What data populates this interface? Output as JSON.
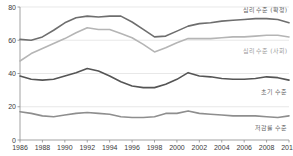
{
  "chart_data": {
    "type": "line",
    "title": "",
    "subtitle": "",
    "xlabel": "",
    "ylabel": "",
    "xlim": [
      1986,
      2010
    ],
    "ylim": [
      0,
      80
    ],
    "yticks": [
      0,
      20,
      40,
      60,
      80
    ],
    "xticks": [
      1986,
      1988,
      1990,
      1992,
      1994,
      1996,
      1998,
      2000,
      2002,
      2004,
      2006,
      2008,
      2010
    ],
    "grid": true,
    "legend_position": "inline-right",
    "x": [
      1986,
      1987,
      1988,
      1989,
      1990,
      1991,
      1992,
      1993,
      1994,
      1995,
      1996,
      1997,
      1998,
      1999,
      2000,
      2001,
      2002,
      2003,
      2004,
      2005,
      2006,
      2007,
      2008,
      2009,
      2010
    ],
    "series": [
      {
        "name": "심리 수준 (확정)",
        "color": "#6e6e6e",
        "values": [
          60.5,
          60.0,
          62.0,
          66.0,
          70.5,
          73.5,
          74.5,
          74.0,
          74.5,
          74.5,
          71.0,
          66.5,
          62.0,
          62.5,
          65.5,
          68.5,
          70.0,
          70.5,
          71.5,
          72.0,
          72.5,
          73.0,
          73.0,
          72.5,
          70.5
        ]
      },
      {
        "name": "심리 수준 (사회)",
        "color": "#b5b5b5",
        "values": [
          47.5,
          52.0,
          55.0,
          58.0,
          61.0,
          64.5,
          67.5,
          66.5,
          66.5,
          64.0,
          61.5,
          57.5,
          53.0,
          55.5,
          58.5,
          61.0,
          61.0,
          61.0,
          61.5,
          62.0,
          62.0,
          62.5,
          63.0,
          63.0,
          62.0
        ]
      },
      {
        "name": "초기 수준",
        "color": "#555555",
        "values": [
          38.5,
          36.5,
          36.0,
          36.5,
          38.5,
          40.5,
          43.0,
          41.5,
          38.5,
          35.0,
          32.5,
          31.5,
          31.5,
          33.5,
          36.5,
          40.5,
          38.5,
          38.0,
          37.0,
          36.5,
          36.5,
          37.0,
          38.0,
          37.5,
          36.0
        ]
      },
      {
        "name": "저감률 수준",
        "color": "#8e8e8e",
        "values": [
          17.0,
          16.0,
          14.5,
          14.0,
          15.0,
          16.0,
          16.5,
          16.0,
          15.5,
          14.0,
          13.5,
          13.5,
          14.0,
          16.0,
          16.0,
          17.5,
          16.0,
          15.5,
          15.0,
          14.5,
          14.5,
          14.5,
          14.0,
          13.5,
          14.5
        ]
      }
    ]
  },
  "labels": {
    "series_0": "심리 수준 (확정)",
    "series_1": "심리 수준 (사회)",
    "series_2": "초기 수준",
    "series_3": "저감률 수준"
  }
}
